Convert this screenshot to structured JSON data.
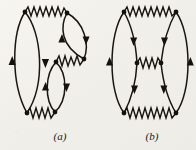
{
  "figure": {
    "background_color": "#f4f2ed",
    "ink_color": "#181512",
    "width": 196,
    "height": 150,
    "panels": [
      {
        "id": "a",
        "label": "(a)",
        "label_x": 60,
        "label_y": 140,
        "description": "Fourth-order electron self-energy style vacuum diagram: a large fermion loop on the left joined by a photon line across the top to a small right-hand fermion loop, plus a second small fermion loop below joined by a short photon line and a photon line along the bottom.",
        "vertices": [
          {
            "name": "top-left-vertex",
            "x": 25,
            "y": 12
          },
          {
            "name": "top-right-vertex",
            "x": 67,
            "y": 13
          },
          {
            "name": "upper-right-lower-vertex",
            "x": 84,
            "y": 59
          },
          {
            "name": "mid-left-vertex",
            "x": 56,
            "y": 62
          },
          {
            "name": "bottom-left-vertex",
            "x": 27,
            "y": 113
          },
          {
            "name": "bottom-right-vertex",
            "x": 55,
            "y": 112
          }
        ],
        "photon_lines": [
          {
            "name": "photon-top",
            "from": "top-left-vertex",
            "to": "top-right-vertex",
            "peaks": 7
          },
          {
            "name": "photon-middle-short",
            "from": "mid-left-vertex",
            "to": "upper-right-lower-vertex",
            "peaks": 3
          },
          {
            "name": "photon-bottom",
            "from": "bottom-left-vertex",
            "to": "bottom-right-vertex",
            "peaks": 6
          }
        ],
        "fermion_loops": [
          {
            "name": "large-left-loop",
            "arrow_left": "up",
            "arrow_right": "down"
          },
          {
            "name": "small-upper-right-loop",
            "arrow_left": "up",
            "arrow_right": "down"
          },
          {
            "name": "small-middle-loop",
            "arrow_left": "up",
            "arrow_right": "down"
          }
        ]
      },
      {
        "id": "b",
        "label": "(b)",
        "label_x": 152,
        "label_y": 140,
        "description": "Fourth-order vacuum polarization style diagram: two fermion loops side by side forming a ladder, joined by photon lines at top, middle and bottom.",
        "vertices": [
          {
            "name": "top-left-vertex",
            "x": 124,
            "y": 12
          },
          {
            "name": "top-right-vertex",
            "x": 176,
            "y": 12
          },
          {
            "name": "mid-left-vertex",
            "x": 137,
            "y": 63
          },
          {
            "name": "mid-right-vertex",
            "x": 161,
            "y": 63
          },
          {
            "name": "bottom-left-vertex",
            "x": 124,
            "y": 113
          },
          {
            "name": "bottom-right-vertex",
            "x": 176,
            "y": 113
          }
        ],
        "photon_lines": [
          {
            "name": "photon-top",
            "from": "top-left-vertex",
            "to": "top-right-vertex",
            "peaks": 8
          },
          {
            "name": "photon-middle",
            "from": "mid-left-vertex",
            "to": "mid-right-vertex",
            "peaks": 3
          },
          {
            "name": "photon-bottom",
            "from": "bottom-left-vertex",
            "to": "bottom-right-vertex",
            "peaks": 8
          }
        ],
        "fermion_arcs": [
          {
            "name": "outer-left-arc",
            "arrow": "up"
          },
          {
            "name": "inner-left-upper-arc",
            "arrow": "down"
          },
          {
            "name": "inner-left-lower-arc",
            "arrow": "down"
          },
          {
            "name": "inner-right-upper-arc",
            "arrow": "down"
          },
          {
            "name": "inner-right-lower-arc",
            "arrow": "down"
          },
          {
            "name": "outer-right-arc",
            "arrow": "up"
          }
        ]
      }
    ]
  }
}
